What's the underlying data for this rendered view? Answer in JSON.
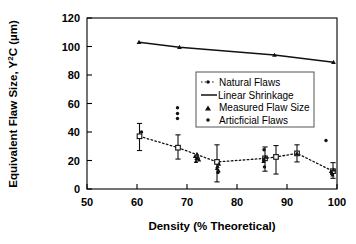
{
  "chart_data": {
    "type": "scatter",
    "title": "",
    "xlabel": "Density (% Theoretical)",
    "ylabel": "Equivalent Flaw Size, Y²C (µm)",
    "ylabel_parts": {
      "main": "Equivalent Flaw Size, Y",
      "sup": "2",
      "tail": "C (µm)"
    },
    "xlim": [
      50,
      100
    ],
    "ylim": [
      0,
      120
    ],
    "xticks": [
      50,
      60,
      70,
      80,
      90,
      100
    ],
    "yticks": [
      0,
      20,
      40,
      60,
      80,
      100,
      120
    ],
    "grid": false,
    "legend_position": "center-right",
    "legend": [
      {
        "label": "Natural Flaws",
        "marker": "dotted-line-with-dot"
      },
      {
        "label": "Linear Shrinkage",
        "marker": "solid-line"
      },
      {
        "label": "Measured Flaw Size",
        "marker": "triangle"
      },
      {
        "label": "Articficial Flaws",
        "marker": "dot"
      }
    ],
    "series": [
      {
        "name": "Linear Shrinkage",
        "type": "line",
        "marker": "triangle",
        "points": [
          {
            "x": 60.4,
            "y": 103.0
          },
          {
            "x": 68.5,
            "y": 99.5
          },
          {
            "x": 87.5,
            "y": 94.0
          },
          {
            "x": 99.3,
            "y": 89.0
          }
        ]
      },
      {
        "name": "Natural Flaws",
        "type": "line-errorbar",
        "marker": "square",
        "points": [
          {
            "x": 60.5,
            "y": 37.0,
            "err_low": 10.0,
            "err_high": 9.0
          },
          {
            "x": 68.2,
            "y": 29.0,
            "err_low": 8.0,
            "err_high": 9.0
          },
          {
            "x": 76.0,
            "y": 19.0,
            "err_low": 14.0,
            "err_high": 12.0
          },
          {
            "x": 85.6,
            "y": 21.5,
            "err_low": 9.0,
            "err_high": 8.0
          },
          {
            "x": 87.8,
            "y": 22.5,
            "err_low": 12.0,
            "err_high": 8.0
          },
          {
            "x": 92.0,
            "y": 25.0,
            "err_low": 6.0,
            "err_high": 6.0
          },
          {
            "x": 99.2,
            "y": 12.5,
            "err_low": 5.0,
            "err_high": 6.0
          }
        ]
      },
      {
        "name": "Measured Flaw Size",
        "type": "scatter",
        "marker": "triangle",
        "points": [
          {
            "x": 71.6,
            "y": 23.0
          },
          {
            "x": 71.9,
            "y": 21.5
          },
          {
            "x": 72.2,
            "y": 22.5
          },
          {
            "x": 72.0,
            "y": 24.5
          },
          {
            "x": 72.4,
            "y": 20.5
          },
          {
            "x": 71.8,
            "y": 19.5
          },
          {
            "x": 76.1,
            "y": 16.0
          },
          {
            "x": 76.4,
            "y": 17.5
          },
          {
            "x": 76.0,
            "y": 14.5
          },
          {
            "x": 76.3,
            "y": 13.0
          },
          {
            "x": 85.4,
            "y": 21.0
          },
          {
            "x": 85.7,
            "y": 22.5
          },
          {
            "x": 85.3,
            "y": 19.5
          },
          {
            "x": 92.0,
            "y": 25.0
          },
          {
            "x": 98.8,
            "y": 12.5
          },
          {
            "x": 99.0,
            "y": 11.0
          },
          {
            "x": 99.3,
            "y": 13.5
          },
          {
            "x": 99.1,
            "y": 10.0
          }
        ]
      },
      {
        "name": "Articficial Flaws",
        "type": "scatter",
        "marker": "dot",
        "points": [
          {
            "x": 68.1,
            "y": 57.0
          },
          {
            "x": 68.1,
            "y": 53.0
          },
          {
            "x": 68.1,
            "y": 49.5
          },
          {
            "x": 75.2,
            "y": 47.0
          },
          {
            "x": 60.9,
            "y": 40.0
          },
          {
            "x": 76.2,
            "y": 11.5
          },
          {
            "x": 85.4,
            "y": 27.5
          },
          {
            "x": 85.5,
            "y": 15.5
          },
          {
            "x": 97.8,
            "y": 34.0
          }
        ]
      }
    ]
  }
}
